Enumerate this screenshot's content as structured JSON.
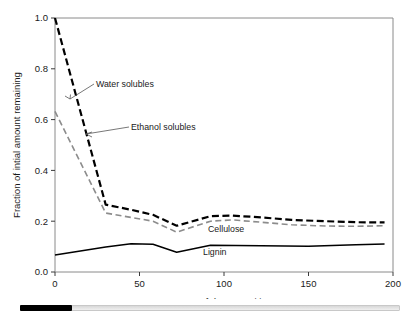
{
  "chart_data": {
    "type": "line",
    "title": "",
    "xlabel": "Days of decomposition",
    "ylabel": "Fraction of intial amount remaining",
    "xlim": [
      0,
      200
    ],
    "ylim": [
      0.0,
      1.0
    ],
    "xticks": [
      "0",
      "50",
      "100",
      "150",
      "200"
    ],
    "xtick_values": [
      0,
      50,
      100,
      150,
      200
    ],
    "yticks": [
      "0.0",
      "0.2",
      "0.4",
      "0.6",
      "0.8",
      "1.0"
    ],
    "ytick_values": [
      0.0,
      0.2,
      0.4,
      0.6,
      0.8,
      1.0
    ],
    "grid": false,
    "legend": "none",
    "series": [
      {
        "name": "Water solubles",
        "color": "#000000",
        "style": "dashed",
        "width": 2.2,
        "x": [
          0,
          30,
          45,
          58,
          72,
          92,
          105,
          122,
          140,
          160,
          178,
          195
        ],
        "y": [
          1.0,
          0.265,
          0.245,
          0.225,
          0.182,
          0.22,
          0.222,
          0.215,
          0.205,
          0.2,
          0.196,
          0.195
        ]
      },
      {
        "name": "Ethanol solubles",
        "color": "#8c8c8c",
        "style": "dashed",
        "width": 1.6,
        "x": [
          0,
          30,
          45,
          58,
          72,
          92,
          105,
          122,
          140,
          160,
          178,
          195
        ],
        "y": [
          0.632,
          0.232,
          0.215,
          0.2,
          0.157,
          0.2,
          0.205,
          0.196,
          0.186,
          0.181,
          0.18,
          0.182
        ]
      },
      {
        "name": "Cellulose",
        "color": "#000000",
        "style": "dashed",
        "width": 2.2,
        "x": [],
        "y": []
      },
      {
        "name": "Lignin",
        "color": "#000000",
        "style": "solid",
        "width": 1.5,
        "x": [
          0,
          30,
          45,
          58,
          72,
          92,
          122,
          150,
          178,
          195
        ],
        "y": [
          0.067,
          0.098,
          0.111,
          0.109,
          0.078,
          0.105,
          0.103,
          0.101,
          0.107,
          0.11
        ]
      }
    ],
    "annotations": [
      {
        "text": "Water solubles",
        "x": 96,
        "y": 87,
        "anchor": "start"
      },
      {
        "text": "Ethanol solubles",
        "x": 131,
        "y": 130,
        "anchor": "start"
      },
      {
        "text": "Cellulose",
        "x": 208,
        "y": 232,
        "anchor": "start"
      },
      {
        "text": "Lignin",
        "x": 203,
        "y": 255,
        "anchor": "start"
      }
    ]
  },
  "scrollbar": {
    "name": "horizontal-scrollbar"
  }
}
